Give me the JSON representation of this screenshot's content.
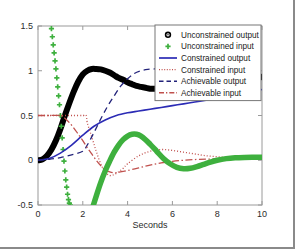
{
  "chart_data": {
    "type": "line",
    "title": "",
    "xlabel": "Seconds",
    "ylabel": "",
    "xlim": [
      0,
      10
    ],
    "ylim": [
      -0.5,
      1.5
    ],
    "xticks": [
      "0",
      "2",
      "4",
      "6",
      "8",
      "10"
    ],
    "xtick_values": [
      0,
      2,
      4,
      6,
      8,
      10
    ],
    "yticks": [
      "-0.5",
      "0",
      "0.5",
      "1",
      "1.5"
    ],
    "ytick_values": [
      -0.5,
      0,
      0.5,
      1,
      1.5
    ],
    "grid": false,
    "legend_position": "top-right",
    "series": [
      {
        "name": "Unconstrained output",
        "marker": "o",
        "style": "thick-marker-line",
        "color": "#000000",
        "x": [
          0.0,
          0.2,
          0.4,
          0.6,
          0.8,
          1.0,
          1.2,
          1.4,
          1.6,
          1.8,
          2.0,
          2.2,
          2.4,
          2.6,
          2.8,
          3.0,
          3.2,
          3.4,
          3.6,
          3.8,
          4.0,
          4.2,
          4.4,
          4.6,
          4.8,
          5.0,
          5.2,
          5.4,
          10.0
        ],
        "y": [
          0.0,
          0.01,
          0.05,
          0.12,
          0.22,
          0.35,
          0.5,
          0.64,
          0.77,
          0.88,
          0.96,
          1.0,
          1.02,
          1.02,
          1.015,
          1.0,
          0.98,
          0.95,
          0.92,
          0.9,
          0.87,
          0.85,
          0.83,
          0.82,
          0.81,
          0.8,
          0.8,
          0.8,
          0.93
        ]
      },
      {
        "name": "Unconstrained input",
        "marker": "+",
        "style": "markers",
        "color": "#3eb03e",
        "x": [
          0.6,
          0.64,
          0.68,
          0.72,
          0.76,
          0.8,
          0.84,
          0.88,
          0.92,
          0.96,
          1.0,
          1.04,
          1.08,
          1.12,
          1.16,
          1.2,
          1.24,
          1.28,
          1.32,
          1.36,
          1.4,
          1.44
        ],
        "y": [
          1.47,
          1.38,
          1.29,
          1.2,
          1.11,
          1.02,
          0.92,
          0.82,
          0.72,
          0.62,
          0.5,
          0.38,
          0.25,
          0.12,
          -0.01,
          -0.12,
          -0.22,
          -0.3,
          -0.38,
          -0.44,
          -0.48,
          -0.5
        ]
      },
      {
        "name": "Constrained output",
        "marker": "none",
        "style": "solid",
        "color": "#2b2bb5",
        "x": [
          0.0,
          0.5,
          1.0,
          1.5,
          2.0,
          2.5,
          3.0,
          3.5,
          4.0,
          4.5,
          5.0,
          5.5,
          6.0,
          6.5,
          7.0,
          7.5,
          8.0,
          8.5,
          9.0,
          9.5,
          10.0
        ],
        "y": [
          0.0,
          0.02,
          0.08,
          0.17,
          0.28,
          0.38,
          0.45,
          0.5,
          0.53,
          0.55,
          0.57,
          0.59,
          0.61,
          0.63,
          0.65,
          0.67,
          0.69,
          0.71,
          0.74,
          0.76,
          0.79
        ]
      },
      {
        "name": "Constrained input",
        "marker": "none",
        "style": "dotted",
        "color": "#c0504d",
        "x": [
          0.0,
          0.5,
          1.0,
          1.5,
          2.0,
          2.15,
          2.2,
          2.4,
          2.6,
          2.8,
          3.0,
          3.2,
          3.4,
          3.6,
          3.8,
          4.0,
          4.5,
          5.0,
          5.5,
          6.0,
          6.5,
          7.0,
          7.5,
          8.0,
          8.5,
          9.0,
          9.5,
          10.0
        ],
        "y": [
          0.5,
          0.5,
          0.5,
          0.5,
          0.5,
          0.5,
          0.42,
          0.26,
          0.1,
          -0.04,
          -0.13,
          -0.17,
          -0.16,
          -0.13,
          -0.09,
          -0.04,
          0.05,
          0.1,
          0.12,
          0.11,
          0.09,
          0.07,
          0.05,
          0.04,
          0.03,
          0.03,
          0.03,
          0.03
        ]
      },
      {
        "name": "Achievable output",
        "marker": "none",
        "style": "dashed",
        "color": "#22227a",
        "x": [
          0.0,
          0.5,
          1.0,
          1.5,
          2.0,
          2.2,
          2.5,
          2.8,
          3.1,
          3.4,
          3.7,
          4.0,
          4.3,
          4.6,
          4.9,
          5.2,
          5.4
        ],
        "y": [
          0.0,
          0.01,
          0.03,
          0.06,
          0.1,
          0.17,
          0.31,
          0.46,
          0.6,
          0.72,
          0.83,
          0.91,
          0.97,
          1.0,
          1.015,
          1.02,
          1.02
        ]
      },
      {
        "name": "Achievable input",
        "marker": "none",
        "style": "dashdot",
        "color": "#c0504d",
        "x": [
          0.0,
          0.5,
          1.0,
          1.2,
          1.4,
          1.6,
          1.8,
          2.0,
          2.2,
          2.4,
          2.6,
          2.8,
          3.0,
          3.2,
          3.4,
          3.6,
          3.8,
          4.0,
          4.5,
          5.0,
          5.5,
          6.0,
          6.5,
          7.0,
          7.5,
          8.0,
          8.5,
          9.0,
          9.5,
          10.0
        ],
        "y": [
          0.5,
          0.5,
          0.5,
          0.47,
          0.42,
          0.36,
          0.29,
          0.22,
          0.14,
          0.07,
          0.0,
          -0.06,
          -0.11,
          -0.13,
          -0.14,
          -0.135,
          -0.125,
          -0.115,
          -0.085,
          -0.055,
          -0.03,
          -0.012,
          0.0,
          0.008,
          0.012,
          0.015,
          0.018,
          0.02,
          0.022,
          0.025
        ]
      }
    ]
  },
  "legend": {
    "entries": [
      {
        "label": "Unconstrained output",
        "glyph": "circle-marker",
        "color": "#000000"
      },
      {
        "label": "Unconstrained input",
        "glyph": "plus-marker",
        "color": "#3eb03e"
      },
      {
        "label": "Constrained output",
        "glyph": "solid-line",
        "color": "#2b2bb5"
      },
      {
        "label": "Constrained input",
        "glyph": "dotted-line",
        "color": "#c0504d"
      },
      {
        "label": "Achievable output",
        "glyph": "dashed-line",
        "color": "#22227a"
      },
      {
        "label": "Achievable input",
        "glyph": "dashdot-line",
        "color": "#c0504d"
      }
    ]
  }
}
